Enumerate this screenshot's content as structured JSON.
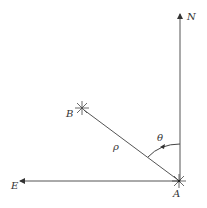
{
  "diagram": {
    "labels": {
      "north": "N",
      "east": "E",
      "point_a": "A",
      "point_b": "B",
      "distance": "ρ",
      "angle": "θ"
    },
    "colors": {
      "line": "#555555",
      "text": "#333333",
      "background": "#ffffff"
    }
  }
}
